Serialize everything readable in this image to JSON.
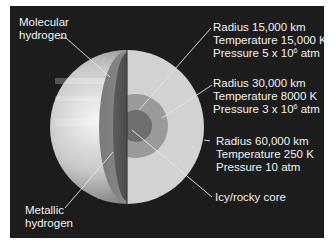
{
  "figure": {
    "colors": {
      "background": "#1c1c1c",
      "label_text": "#f2f2f2",
      "leader_line": "#e0e0e0",
      "outer_layer": "#d2d2d2",
      "middle_layer": "#9a9a9a",
      "core": "#6e6e6e"
    },
    "labels": {
      "molecular_hydrogen": [
        "Molecular",
        "hydrogen"
      ],
      "metallic_hydrogen": [
        "Metallic",
        "hydrogen"
      ],
      "layer_1": {
        "radius": "Radius 15,000 km",
        "temperature": "Temperature 15,000 K",
        "pressure_prefix": "Pressure 5 x 10",
        "pressure_exp": "6",
        "pressure_suffix": " atm"
      },
      "layer_2": {
        "radius": "Radius 30,000 km",
        "temperature": "Temperature 8000 K",
        "pressure_prefix": "Pressure 3 x 10",
        "pressure_exp": "6",
        "pressure_suffix": " atm"
      },
      "layer_3": {
        "radius": "Radius 60,000 km",
        "temperature": "Temperature 250 K",
        "pressure": "Pressure 10 atm"
      },
      "core": "Icy/rocky core"
    }
  }
}
